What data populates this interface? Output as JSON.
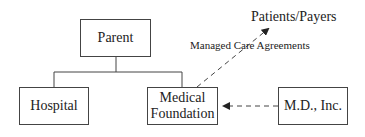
{
  "diagram": {
    "type": "org-structure",
    "nodes": [
      {
        "id": "parent",
        "label": "Parent"
      },
      {
        "id": "hospital",
        "label": "Hospital"
      },
      {
        "id": "medical_foundation",
        "label": "Medical\nFoundation",
        "line1": "Medical",
        "line2": "Foundation"
      },
      {
        "id": "md_inc",
        "label": "M.D., Inc."
      }
    ],
    "external": {
      "patients_payers": "Patients/Payers"
    },
    "edges": [
      {
        "from": "parent",
        "to": "hospital",
        "style": "solid"
      },
      {
        "from": "parent",
        "to": "medical_foundation",
        "style": "solid"
      },
      {
        "from": "medical_foundation",
        "to": "patients_payers",
        "style": "dashed-arrow",
        "label": "Managed Care Agreements"
      },
      {
        "from": "md_inc",
        "to": "medical_foundation",
        "style": "dashed-arrow"
      }
    ],
    "edge_label_managed": "Managed Care Agreements"
  },
  "colors": {
    "line": "#444444",
    "text": "#222222",
    "background": "#ffffff"
  }
}
